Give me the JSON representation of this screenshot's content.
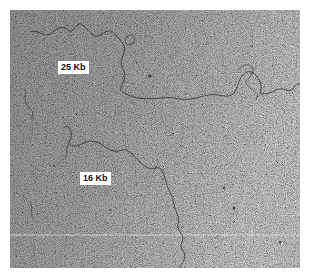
{
  "image": {
    "type": "electron micrograph",
    "subject": "DNA molecules",
    "background_tone": "#9a9a9a",
    "strand_color": "#2a2a2a"
  },
  "labels": [
    {
      "text": "25 Kb",
      "x": 58,
      "y": 61
    },
    {
      "text": "16 Kb",
      "x": 80,
      "y": 172
    }
  ]
}
